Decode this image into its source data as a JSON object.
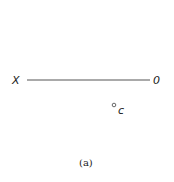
{
  "diagram": {
    "labels": {
      "left_end": "X",
      "right_end": "0",
      "point": "c"
    },
    "caption": "(a)",
    "colors": {
      "line": "#555555",
      "text": "#222222"
    }
  }
}
